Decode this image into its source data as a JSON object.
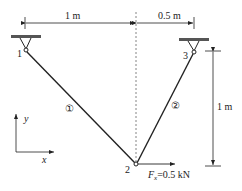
{
  "diagram": {
    "type": "two-bar truss",
    "dimensions": {
      "horizontal_left": "1 m",
      "horizontal_right": "0.5 m",
      "vertical": "1 m"
    },
    "nodes": [
      {
        "id": "1",
        "label": "1"
      },
      {
        "id": "2",
        "label": "2"
      },
      {
        "id": "3",
        "label": "3"
      }
    ],
    "members": [
      {
        "id": "1",
        "label": "①"
      },
      {
        "id": "2",
        "label": "②"
      }
    ],
    "load": {
      "symbol": "F",
      "subscript": "x",
      "value": "=0.5 kN"
    },
    "axes": {
      "x_label": "x",
      "y_label": "y"
    },
    "colors": {
      "line": "#222222",
      "support": "#555555",
      "centerline": "#666666"
    }
  }
}
